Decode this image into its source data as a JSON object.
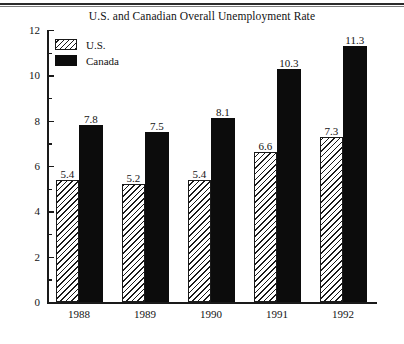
{
  "chart_data": {
    "type": "bar",
    "title": "U.S. and Canadian Overall Unemployment Rate",
    "xlabel": "",
    "ylabel": "",
    "categories": [
      "1988",
      "1989",
      "1990",
      "1991",
      "1992"
    ],
    "series": [
      {
        "name": "U.S.",
        "values": [
          5.4,
          5.2,
          5.4,
          6.6,
          7.3
        ],
        "fill": "diagonal-hatch",
        "color": "#1a1a1a"
      },
      {
        "name": "Canada",
        "values": [
          7.8,
          7.5,
          8.1,
          10.3,
          11.3
        ],
        "fill": "solid",
        "color": "#0c0c0c"
      }
    ],
    "ylim": [
      0,
      12
    ],
    "ymajor_ticks": [
      0,
      2,
      4,
      6,
      8,
      10,
      12
    ],
    "yminor_ticks": [
      1,
      3,
      5,
      7,
      9,
      11
    ],
    "ytick_labels": [
      "0",
      "2",
      "4",
      "6",
      "8",
      "10",
      "12"
    ],
    "grid": false,
    "legend_position": "top-left",
    "data_labels": true
  },
  "legend": {
    "entries": [
      {
        "label": "U.S.",
        "swatch": "hatched-swatch"
      },
      {
        "label": "Canada",
        "swatch": "solid-black-swatch"
      }
    ]
  }
}
